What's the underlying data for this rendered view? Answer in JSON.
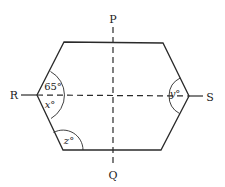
{
  "figure": {
    "type": "geometry-diagram",
    "shape": "hexagon",
    "stroke_color": "#2a2a2a",
    "vertices": {
      "top_left": [
        64,
        42
      ],
      "top_right": [
        163,
        43
      ],
      "right": [
        189,
        96
      ],
      "bottom_right": [
        161,
        150
      ],
      "bottom_left": [
        63,
        150
      ],
      "left": [
        37,
        95
      ]
    },
    "lines": [
      {
        "name": "PQ",
        "style": "dashed",
        "orientation": "vertical"
      },
      {
        "name": "RS",
        "style": "dashed",
        "orientation": "horizontal"
      }
    ]
  },
  "points": {
    "P": "P",
    "Q": "Q",
    "R": "R",
    "S": "S"
  },
  "angles": {
    "left_upper": "65°",
    "left_lower_var": "x",
    "left_lower_deg": "°",
    "right_var": "y",
    "right_deg": "°",
    "bottom_left_var": "z",
    "bottom_left_deg": "°"
  }
}
